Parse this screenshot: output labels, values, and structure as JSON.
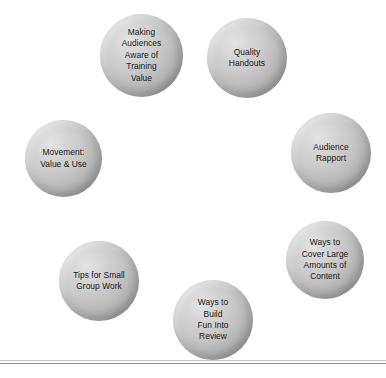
{
  "diagram": {
    "type": "bubble-cluster",
    "background_color": "#ffffff",
    "bubble_fill_light": "#e3e3e3",
    "bubble_fill_dark": "#8f8f8f",
    "text_color": "#171717",
    "rule_color": "#8d8d8d",
    "bubbles": [
      {
        "id": "making-audiences-aware-of-training-value",
        "label": "Making\nAudiences\nAware of\nTraining\nValue",
        "lines": [
          "Making",
          "Audiences",
          "Aware of",
          "Training",
          "Value"
        ],
        "x": 100,
        "y": 14,
        "size": 83
      },
      {
        "id": "quality-handouts",
        "label": "Quality\nHandouts",
        "lines": [
          "Quality",
          "Handouts"
        ],
        "x": 207,
        "y": 18,
        "size": 80
      },
      {
        "id": "audience-rapport",
        "label": "Audience\nRapport",
        "lines": [
          "Audience",
          "Rapport"
        ],
        "x": 291,
        "y": 113,
        "size": 80
      },
      {
        "id": "movement-value-and-use",
        "label": "Movement:\nValue & Use",
        "lines": [
          "Movement:",
          "Value & Use"
        ],
        "x": 25,
        "y": 120,
        "size": 77
      },
      {
        "id": "ways-to-cover-large-amounts-of-content",
        "label": "Ways to\nCover Large\nAmounts of\nContent",
        "lines": [
          "Ways to",
          "Cover Large",
          "Amounts of",
          "Content"
        ],
        "x": 286,
        "y": 221,
        "size": 78
      },
      {
        "id": "tips-for-small-group-work",
        "label": "Tips for Small\nGroup Work",
        "lines": [
          "Tips for Small",
          "Group Work"
        ],
        "x": 59,
        "y": 241,
        "size": 80
      },
      {
        "id": "ways-to-build-fun-into-review",
        "label": "Ways to\nBuild\nFun Into\nReview",
        "lines": [
          "Ways to",
          "Build",
          "Fun Into",
          "Review"
        ],
        "x": 173,
        "y": 280,
        "size": 80
      }
    ],
    "rules": [
      {
        "id": "footer-rule-thin",
        "y": 360,
        "style": "thin"
      },
      {
        "id": "footer-rule",
        "y": 363,
        "style": "solid"
      }
    ]
  }
}
